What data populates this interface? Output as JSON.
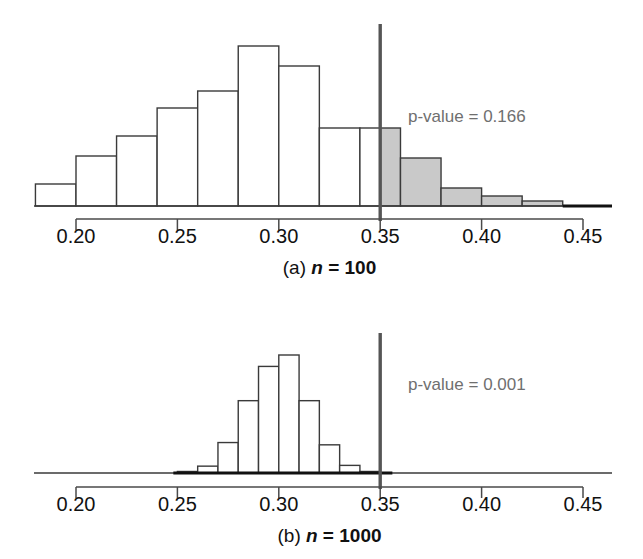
{
  "figure": {
    "background_color": "#ffffff",
    "bar_fill_color": "#ffffff",
    "bar_shaded_color": "#c9c9c9",
    "bar_stroke_color": "#3a3a3a",
    "axis_color": "#4a4a4a",
    "pvalue_text_color": "#6f6f6f",
    "cutoff_line_color": "#555555"
  },
  "panels": [
    {
      "id": "panel-a",
      "caption_prefix": "(a)",
      "caption_variable": "n",
      "caption_value": "= 100",
      "caption_full": "(a) n = 100",
      "pvalue_label": "p-value = 0.166",
      "pvalue": 0.166,
      "cutoff": 0.35,
      "axis": {
        "ticks": [
          0.2,
          0.25,
          0.3,
          0.35,
          0.4,
          0.45
        ],
        "tick_labels": [
          "0.20",
          "0.25",
          "0.30",
          "0.35",
          "0.40",
          "0.45"
        ],
        "min": 0.2,
        "max": 0.45
      },
      "chart_data": {
        "type": "bar",
        "title": "(a) n = 100",
        "xlabel": "",
        "ylabel": "",
        "grid": false,
        "bin_width": 0.02,
        "bin_starts": [
          0.18,
          0.2,
          0.22,
          0.24,
          0.26,
          0.28,
          0.3,
          0.32,
          0.34,
          0.36,
          0.38,
          0.4,
          0.42
        ],
        "bin_ends": [
          0.2,
          0.22,
          0.24,
          0.26,
          0.28,
          0.3,
          0.32,
          0.34,
          0.36,
          0.38,
          0.4,
          0.42,
          0.44
        ],
        "categories": [
          "0.18-0.20",
          "0.20-0.22",
          "0.22-0.24",
          "0.24-0.26",
          "0.26-0.28",
          "0.28-0.30",
          "0.30-0.32",
          "0.32-0.34",
          "0.34-0.36",
          "0.36-0.38",
          "0.38-0.40",
          "0.40-0.42",
          "0.42-0.44"
        ],
        "values": [
          22,
          50,
          70,
          98,
          115,
          160,
          140,
          78,
          78,
          48,
          18,
          10,
          5
        ],
        "shaded_from": 0.35,
        "shaded_flags": [
          false,
          false,
          false,
          false,
          false,
          false,
          false,
          false,
          true,
          true,
          true,
          true,
          true
        ],
        "split_bin": {
          "start": 0.34,
          "end": 0.36,
          "split_at": 0.35,
          "left_shaded": false,
          "right_shaded": true
        }
      }
    },
    {
      "id": "panel-b",
      "caption_prefix": "(b)",
      "caption_variable": "n",
      "caption_value": "= 1000",
      "caption_full": "(b) n = 1000",
      "pvalue_label": "p-value = 0.001",
      "pvalue": 0.001,
      "cutoff": 0.35,
      "axis": {
        "ticks": [
          0.2,
          0.25,
          0.3,
          0.35,
          0.4,
          0.45
        ],
        "tick_labels": [
          "0.20",
          "0.25",
          "0.30",
          "0.35",
          "0.40",
          "0.45"
        ],
        "min": 0.2,
        "max": 0.45
      },
      "chart_data": {
        "type": "bar",
        "title": "(b) n = 1000",
        "xlabel": "",
        "ylabel": "",
        "grid": false,
        "bin_width": 0.01,
        "bin_starts": [
          0.25,
          0.26,
          0.27,
          0.28,
          0.29,
          0.3,
          0.31,
          0.32,
          0.33,
          0.34
        ],
        "bin_ends": [
          0.26,
          0.27,
          0.28,
          0.29,
          0.3,
          0.31,
          0.32,
          0.33,
          0.34,
          0.35
        ],
        "categories": [
          "0.25-0.26",
          "0.26-0.27",
          "0.27-0.28",
          "0.28-0.29",
          "0.29-0.30",
          "0.30-0.31",
          "0.31-0.32",
          "0.32-0.33",
          "0.33-0.34",
          "0.34-0.35"
        ],
        "values": [
          2,
          9,
          40,
          95,
          140,
          155,
          95,
          37,
          10,
          2
        ],
        "shaded_from": 0.35,
        "shaded_flags": [
          false,
          false,
          false,
          false,
          false,
          false,
          false,
          false,
          false,
          false
        ],
        "baseline_dark_from": 0.248,
        "baseline_dark_to": 0.356
      }
    }
  ]
}
